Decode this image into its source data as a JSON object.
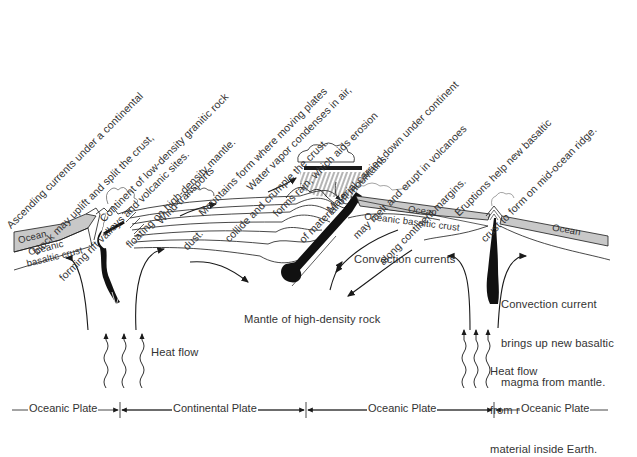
{
  "diagram": {
    "annotations": {
      "ascending_currents": [
        "Ascending currents under a continental",
        "block may uplift and split the crust,",
        "forming rift valleys and volcanic sites."
      ],
      "continent_density": [
        "Continent of low-density granitic rock",
        "floating on high-density mantle."
      ],
      "wind": [
        "Wind transports",
        "dust."
      ],
      "mountains": [
        "Mountains form where moving plates",
        "collide and crumple the crust."
      ],
      "water_vapor": [
        "Water vapor condenses in air,",
        "forms rain, which aids erosion",
        "of material off mountains."
      ],
      "material_carried": [
        "Material carried down under continent",
        "may melt and erupt in volcanoes",
        "along continent margins."
      ],
      "eruptions": [
        "Eruptions help new basaltic",
        "crust to form on mid-ocean ridge."
      ]
    },
    "labels": {
      "ocean_left": "Ocean",
      "oceanic_crust_left_1": "Oceanic",
      "oceanic_crust_left_2": "basaltic crust",
      "ocean_mid": "Ocean",
      "oceanic_crust_mid": "Oceanic basaltic crust",
      "ocean_right": "Ocean",
      "convection_currents": "Convection currents",
      "convection_current_ridge": [
        "Convection current",
        "brings up new basaltic",
        "magma from mantle."
      ],
      "mantle": "Mantle of high-density rock",
      "heat_flow_left": "Heat flow",
      "heat_flow_right": [
        "Heat flow",
        "from radioactive",
        "material inside Earth."
      ]
    },
    "plates": [
      {
        "label": "Oceanic Plate",
        "from_x": 10,
        "to_x": 120
      },
      {
        "label": "Continental Plate",
        "from_x": 120,
        "to_x": 306
      },
      {
        "label": "Oceanic Plate",
        "from_x": 306,
        "to_x": 494
      },
      {
        "label": "Oceanic Plate",
        "from_x": 494,
        "to_x": 612
      }
    ],
    "colors": {
      "ink": "#1a1a1a",
      "ocean_fill": "#c8c8c8",
      "magma": "#111111",
      "text": "#333333"
    }
  }
}
